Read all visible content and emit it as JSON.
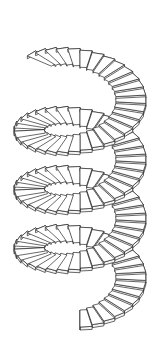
{
  "figure": {
    "background": "#ffffff",
    "line_color": "#2a2a2a",
    "tread_fill": "#ffffff",
    "riser_fill": "#f4f4f4"
  },
  "helix": {
    "center_x": 80,
    "bottom_center_y": 291,
    "drop_per_turn": 59,
    "turns": 3.65,
    "steps_per_turn": 34,
    "outer_rx": 66,
    "outer_ry": 36,
    "inner_rx": 36,
    "inner_ry": 19,
    "tread_thickness": 3,
    "start_angle_deg": 90
  }
}
